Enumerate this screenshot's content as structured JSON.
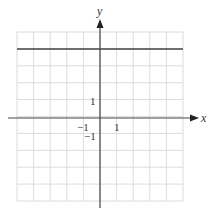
{
  "chart_data": {
    "type": "line",
    "title": "",
    "xlabel": "x",
    "ylabel": "y",
    "xlim": [
      -5,
      5
    ],
    "ylim": [
      -5,
      5
    ],
    "grid": true,
    "tick_labels": {
      "x": [
        {
          "value": -1,
          "label": "−1"
        },
        {
          "value": 1,
          "label": "1"
        }
      ],
      "y": [
        {
          "value": 1,
          "label": "1"
        },
        {
          "value": -1,
          "label": "−1"
        }
      ]
    },
    "series": [
      {
        "name": "y = 4",
        "x": [
          -5,
          5
        ],
        "y": [
          4,
          4
        ],
        "color": "#444444"
      }
    ],
    "colors": {
      "grid": "#dcdcdc",
      "axis": "#444444",
      "line": "#444444"
    }
  },
  "labels": {
    "x_axis": "x",
    "y_axis": "y",
    "tick_x_neg1": "−1",
    "tick_x_pos1": "1",
    "tick_y_pos1": "1",
    "tick_y_neg1": "−1"
  }
}
